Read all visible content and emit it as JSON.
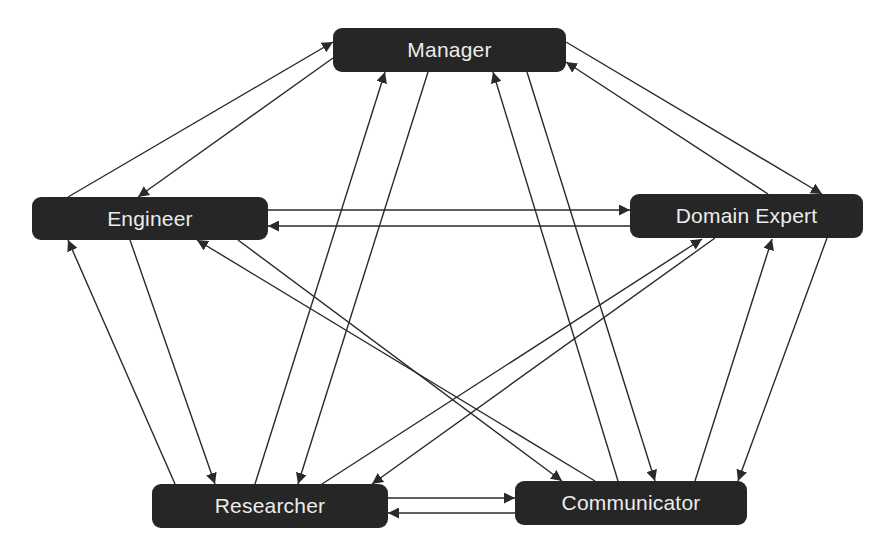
{
  "diagram": {
    "type": "directed-graph",
    "colors": {
      "background": "#ffffff",
      "node_fill": "#262626",
      "node_text": "#ececec",
      "edge": "#2a2a2a"
    },
    "nodes": [
      {
        "id": "manager",
        "label": "Manager",
        "x": 333,
        "y": 28,
        "w": 233,
        "h": 44
      },
      {
        "id": "engineer",
        "label": "Engineer",
        "x": 32,
        "y": 197,
        "w": 236,
        "h": 43
      },
      {
        "id": "domain_expert",
        "label": "Domain Expert",
        "x": 630,
        "y": 194,
        "w": 233,
        "h": 44
      },
      {
        "id": "researcher",
        "label": "Researcher",
        "x": 152,
        "y": 484,
        "w": 236,
        "h": 44
      },
      {
        "id": "communicator",
        "label": "Communicator",
        "x": 515,
        "y": 481,
        "w": 232,
        "h": 44
      }
    ],
    "edges": [
      {
        "from": "engineer",
        "to": "manager",
        "x1": 68,
        "y1": 197,
        "x2": 333,
        "y2": 42
      },
      {
        "from": "manager",
        "to": "engineer",
        "x1": 333,
        "y1": 58,
        "x2": 138,
        "y2": 197
      },
      {
        "from": "manager",
        "to": "domain_expert",
        "x1": 566,
        "y1": 42,
        "x2": 822,
        "y2": 194
      },
      {
        "from": "domain_expert",
        "to": "manager",
        "x1": 768,
        "y1": 194,
        "x2": 566,
        "y2": 62
      },
      {
        "from": "engineer",
        "to": "domain_expert",
        "x1": 268,
        "y1": 210,
        "x2": 630,
        "y2": 210
      },
      {
        "from": "domain_expert",
        "to": "engineer",
        "x1": 630,
        "y1": 226,
        "x2": 268,
        "y2": 226
      },
      {
        "from": "researcher",
        "to": "engineer",
        "x1": 175,
        "y1": 484,
        "x2": 68,
        "y2": 240
      },
      {
        "from": "engineer",
        "to": "researcher",
        "x1": 130,
        "y1": 240,
        "x2": 215,
        "y2": 484
      },
      {
        "from": "researcher",
        "to": "manager",
        "x1": 255,
        "y1": 484,
        "x2": 385,
        "y2": 72
      },
      {
        "from": "manager",
        "to": "researcher",
        "x1": 428,
        "y1": 72,
        "x2": 298,
        "y2": 484
      },
      {
        "from": "communicator",
        "to": "engineer",
        "x1": 595,
        "y1": 481,
        "x2": 197,
        "y2": 240
      },
      {
        "from": "engineer",
        "to": "communicator",
        "x1": 238,
        "y1": 240,
        "x2": 562,
        "y2": 481
      },
      {
        "from": "researcher",
        "to": "domain_expert",
        "x1": 322,
        "y1": 484,
        "x2": 702,
        "y2": 239
      },
      {
        "from": "domain_expert",
        "to": "researcher",
        "x1": 715,
        "y1": 238,
        "x2": 372,
        "y2": 484
      },
      {
        "from": "communicator",
        "to": "manager",
        "x1": 618,
        "y1": 481,
        "x2": 493,
        "y2": 72
      },
      {
        "from": "manager",
        "to": "communicator",
        "x1": 527,
        "y1": 72,
        "x2": 655,
        "y2": 481
      },
      {
        "from": "communicator",
        "to": "domain_expert",
        "x1": 695,
        "y1": 481,
        "x2": 772,
        "y2": 239
      },
      {
        "from": "domain_expert",
        "to": "communicator",
        "x1": 827,
        "y1": 238,
        "x2": 738,
        "y2": 481
      },
      {
        "from": "researcher",
        "to": "communicator",
        "x1": 388,
        "y1": 498,
        "x2": 515,
        "y2": 498
      },
      {
        "from": "communicator",
        "to": "researcher",
        "x1": 515,
        "y1": 513,
        "x2": 388,
        "y2": 513
      }
    ]
  }
}
